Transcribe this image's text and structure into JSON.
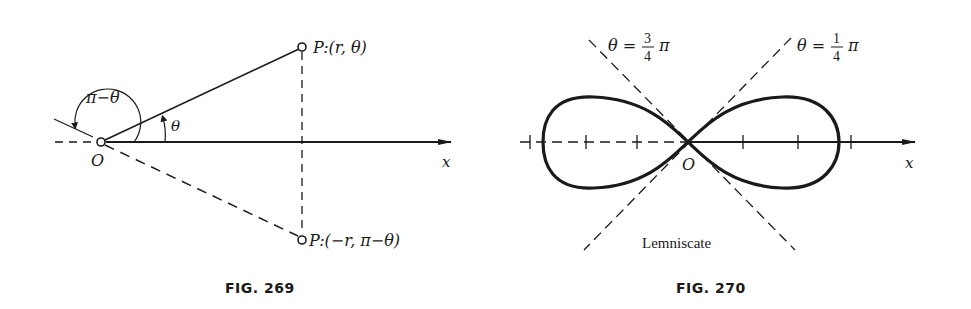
{
  "figures": [
    {
      "caption": "FIG. 269",
      "labels": {
        "origin": "O",
        "axis": "x",
        "point_p": "P:(r, θ)",
        "point_p_neg": "P:(−r, π−θ)",
        "angle_theta": "θ",
        "angle_pi_minus_theta": "π−θ"
      }
    },
    {
      "caption": "FIG. 270",
      "curve_name": "Lemniscate",
      "labels": {
        "origin": "O",
        "axis": "x",
        "asymptote_left": {
          "lhs": "θ =",
          "num": "3",
          "den": "4",
          "rhs": "π"
        },
        "asymptote_right": {
          "lhs": "θ =",
          "num": "1",
          "den": "4",
          "rhs": "π"
        }
      },
      "tick_count_left": 3,
      "tick_count_right": 3
    }
  ],
  "colors": {
    "ink": "#1a1a1a",
    "background": "#ffffff"
  }
}
